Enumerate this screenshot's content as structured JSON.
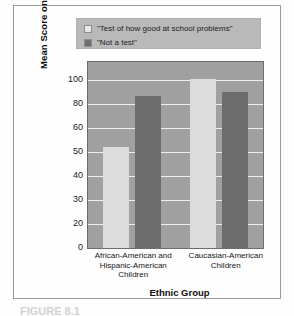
{
  "figure": {
    "caption": "FIGURE 8.1"
  },
  "legend": {
    "position": "top",
    "items": [
      {
        "label": "\"Test of how good at school problems\"",
        "swatch": "light-swatch-icon",
        "color": "#e8e8e8"
      },
      {
        "label": "\"Not a test\"",
        "swatch": "dark-swatch-icon",
        "color": "#6f6f6f"
      }
    ]
  },
  "chart_data": {
    "type": "bar",
    "title": "",
    "xlabel": "Ethnic Group",
    "ylabel": "Mean Score on Verbal Tasks",
    "categories": [
      "African-American and Hispanic-American Children",
      "Caucasian-American Children"
    ],
    "category_lines": [
      [
        "African-American and",
        "Hispanic-American",
        "Children"
      ],
      [
        "Caucasian-American",
        "Children"
      ]
    ],
    "series": [
      {
        "name": "\"Test of how good at school problems\"",
        "values": [
          60,
          100
        ],
        "color": "#dcdcdc"
      },
      {
        "name": "\"Not a test\"",
        "values": [
          90,
          92
        ],
        "color": "#6c6c6c"
      }
    ],
    "ylim": [
      0,
      110
    ],
    "yticks": [
      0,
      20,
      30,
      40,
      50,
      60,
      80,
      100
    ],
    "ytick_labels": [
      "0",
      "20",
      "30",
      "40",
      "50",
      "60",
      "80",
      "100"
    ],
    "grid": true,
    "grid_color": "#efefef",
    "plot_background": "#a0a0a0",
    "legend_position": "above-plot"
  },
  "colors": {
    "frame_border": "#9a9a9a",
    "legend_background": "#b9b9b9",
    "plot_background": "#a0a0a0",
    "gridline": "#efefef",
    "bar_light": "#dcdcdc",
    "bar_dark": "#6c6c6c",
    "text": "#151515"
  }
}
